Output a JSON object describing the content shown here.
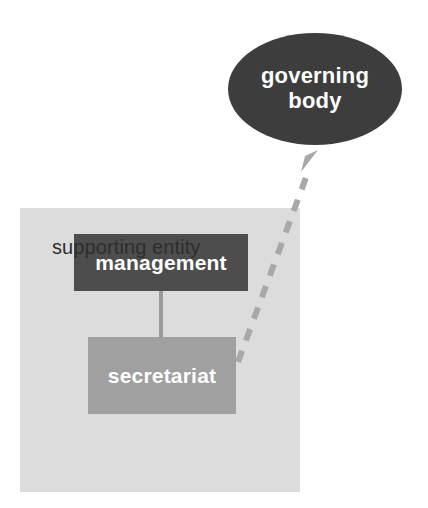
{
  "diagram": {
    "canvas": {
      "width": 428,
      "height": 508,
      "background": "#ffffff"
    },
    "nodes": {
      "governing_body": {
        "label_line1": "governing",
        "label_line2": "body",
        "shape": "ellipse",
        "fill": "#3d3d3d",
        "text_color": "#ffffff"
      },
      "management": {
        "label": "management",
        "shape": "rectangle",
        "fill": "#4d4d4d",
        "text_color": "#ffffff"
      },
      "secretariat": {
        "label": "secretariat",
        "shape": "rectangle",
        "fill": "#a0a0a0",
        "text_color": "#ffffff"
      },
      "supporting_entity": {
        "label": "supporting entity",
        "shape": "panel",
        "fill": "#dcdcdc",
        "text_color": "#2e2e2e"
      }
    },
    "connectors": {
      "management_to_secretariat": {
        "style": "solid",
        "color": "#9a9a9a",
        "arrow": "none"
      },
      "secretariat_to_governing_body": {
        "style": "dashed",
        "color": "#a8a8a8",
        "arrow": "open-triangle"
      }
    }
  }
}
